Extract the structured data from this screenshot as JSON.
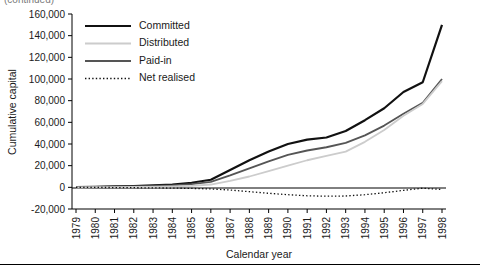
{
  "figure": {
    "cropped_caption_fragment": "(continued)",
    "x_axis_title": "Calendar year",
    "y_axis_title": "Cumulative capital"
  },
  "legend": {
    "position": "inside-top-left",
    "items": [
      {
        "label": "Committed",
        "color": "#111111",
        "width": 2.2,
        "style": "solid"
      },
      {
        "label": "Distributed",
        "color": "#cccccc",
        "width": 1.8,
        "style": "solid"
      },
      {
        "label": "Paid-in",
        "color": "#555555",
        "width": 1.8,
        "style": "solid"
      },
      {
        "label": "Net realised",
        "color": "#111111",
        "width": 1.3,
        "style": "dotted"
      }
    ]
  },
  "chart_data": {
    "type": "line",
    "title": "",
    "xlabel": "Calendar year",
    "ylabel": "Cumulative capital",
    "categories": [
      "1979",
      "1980",
      "1981",
      "1982",
      "1983",
      "1984",
      "1985",
      "1986",
      "1987",
      "1988",
      "1989",
      "1990",
      "1991",
      "1992",
      "1993",
      "1994",
      "1995",
      "1996",
      "1997",
      "1998"
    ],
    "ylim": [
      -20000,
      160000
    ],
    "ytick_step": 20000,
    "yticks": [
      "-20,000",
      "0",
      "20,000",
      "40,000",
      "60,000",
      "80,000",
      "100,000",
      "120,000",
      "140,000",
      "160,000"
    ],
    "grid": false,
    "legend_position": "upper left",
    "series": [
      {
        "name": "Committed",
        "values": [
          300,
          500,
          800,
          1200,
          1800,
          2600,
          4200,
          7000,
          16000,
          25000,
          33000,
          40000,
          44000,
          46000,
          52000,
          62000,
          73000,
          88000,
          97000,
          150000
        ]
      },
      {
        "name": "Paid-in",
        "values": [
          200,
          350,
          550,
          850,
          1300,
          1900,
          3000,
          5000,
          11000,
          17500,
          24000,
          30000,
          34000,
          37000,
          41000,
          48000,
          57000,
          68000,
          78000,
          100000
        ]
      },
      {
        "name": "Distributed",
        "values": [
          50,
          100,
          180,
          300,
          500,
          800,
          1400,
          2600,
          6000,
          10000,
          15000,
          20000,
          25000,
          29000,
          33000,
          42000,
          53000,
          66000,
          77000,
          98000
        ]
      },
      {
        "name": "Net realised",
        "values": [
          -50,
          -100,
          -200,
          -350,
          -500,
          -700,
          -1000,
          -1500,
          -2500,
          -4000,
          -5500,
          -6800,
          -7800,
          -8200,
          -8000,
          -6800,
          -5000,
          -2800,
          -800,
          -2000
        ]
      }
    ]
  }
}
